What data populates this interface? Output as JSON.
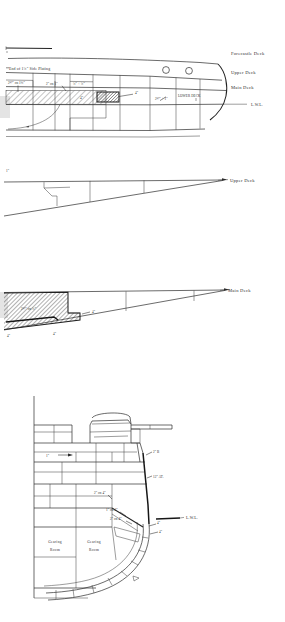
{
  "sheet": {
    "title": "Naval Armour Arrangement — Pencil Drawing",
    "background_color": "#ffffff",
    "ink_color": "#2b2b2b",
    "width": 285,
    "height": 622
  },
  "drawings": [
    {
      "id": "bow-profile-section",
      "name": "Bow Side Profile with Deck Lines",
      "deck_labels": [
        {
          "key": "forecastle",
          "text": "Forecastle Deck"
        },
        {
          "key": "upper",
          "text": "Upper Deck"
        },
        {
          "key": "main",
          "text": "Main Deck"
        },
        {
          "key": "lwl",
          "text": "L.W.L."
        }
      ],
      "interior_labels": [
        {
          "key": "lower_deck",
          "text": "LOWER DECK"
        }
      ],
      "notes": [
        {
          "key": "end_plating",
          "text": "End of 1¾\" Side Plating"
        }
      ],
      "callouts": [
        {
          "key": "belt_a",
          "text": "2½\" on 1¼\""
        },
        {
          "key": "belt_b",
          "text": "2\" on 1\""
        },
        {
          "key": "belt_c",
          "text": "¾\" + ¾\""
        },
        {
          "key": "block_d",
          "text": "4\""
        },
        {
          "key": "block_e",
          "text": "4\""
        },
        {
          "key": "belt_f",
          "text": "2½\" + 1\""
        }
      ],
      "features": [
        {
          "key": "porthole_1",
          "text": "porthole"
        },
        {
          "key": "porthole_2",
          "text": "porthole"
        }
      ]
    },
    {
      "id": "upper-deck-plan",
      "name": "Upper Deck Tapered Plan",
      "deck_labels": [
        {
          "key": "upper",
          "text": "Upper Deck"
        }
      ],
      "callouts": [
        {
          "key": "plate_thickness",
          "text": "1\""
        }
      ]
    },
    {
      "id": "main-deck-plan",
      "name": "Main Deck Tapered Plan with Armour Patch",
      "deck_labels": [
        {
          "key": "main",
          "text": "Main Deck"
        }
      ],
      "callouts": [
        {
          "key": "patch",
          "text": "2½\" on ¾\""
        },
        {
          "key": "edge_right",
          "text": "4\""
        },
        {
          "key": "edge_left",
          "text": "4\""
        },
        {
          "key": "edge_mid",
          "text": "4\""
        }
      ]
    },
    {
      "id": "midship-turret-section",
      "name": "Midship Cross Section with Turret and Machinery Rooms",
      "rooms": [
        {
          "key": "room_left",
          "line1": "Gearing",
          "line2": "Room"
        },
        {
          "key": "room_right",
          "line1": "Gearing",
          "line2": "Room"
        }
      ],
      "deck_labels": [
        {
          "key": "lwl",
          "text": "L.W.L."
        }
      ],
      "callouts": [
        {
          "key": "deck_plate",
          "text": "1\""
        },
        {
          "key": "belt_upper",
          "text": "2\" B"
        },
        {
          "key": "belt_main",
          "text": "12\" AT."
        },
        {
          "key": "slope_a",
          "text": "2\" on 4\""
        },
        {
          "key": "slope_b",
          "text": "1\" on 4\""
        },
        {
          "key": "slope_c",
          "text": "2\" on 4\""
        },
        {
          "key": "bilge_a",
          "text": "4\""
        },
        {
          "key": "bilge_b",
          "text": "4\""
        }
      ],
      "features": [
        {
          "key": "turret",
          "text": "turret"
        },
        {
          "key": "gun_barrel",
          "text": "gun-barrel"
        }
      ]
    }
  ]
}
